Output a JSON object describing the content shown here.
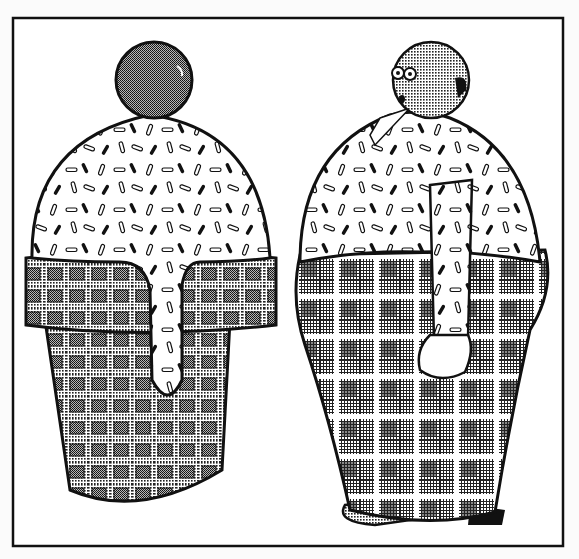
{
  "illustration": {
    "style": "black-and-white halftone cartoon",
    "colors": {
      "ink": "#111111",
      "paper": "#fbfbfb",
      "halftone": "#555555"
    },
    "panel": {
      "x": 13,
      "y": 18,
      "width": 550,
      "height": 528
    },
    "left_figure": {
      "name": "ice-cream-cone",
      "parts": [
        "cherry",
        "sprinkled-ice-cream-scoop",
        "waffle-cone",
        "drip"
      ]
    },
    "right_figure": {
      "name": "bald-man-in-ice-cream-cone-outfit",
      "parts": [
        "bald-head",
        "sprinkled-shirt",
        "arm",
        "hand",
        "plaid-trousers",
        "shoes"
      ]
    }
  }
}
